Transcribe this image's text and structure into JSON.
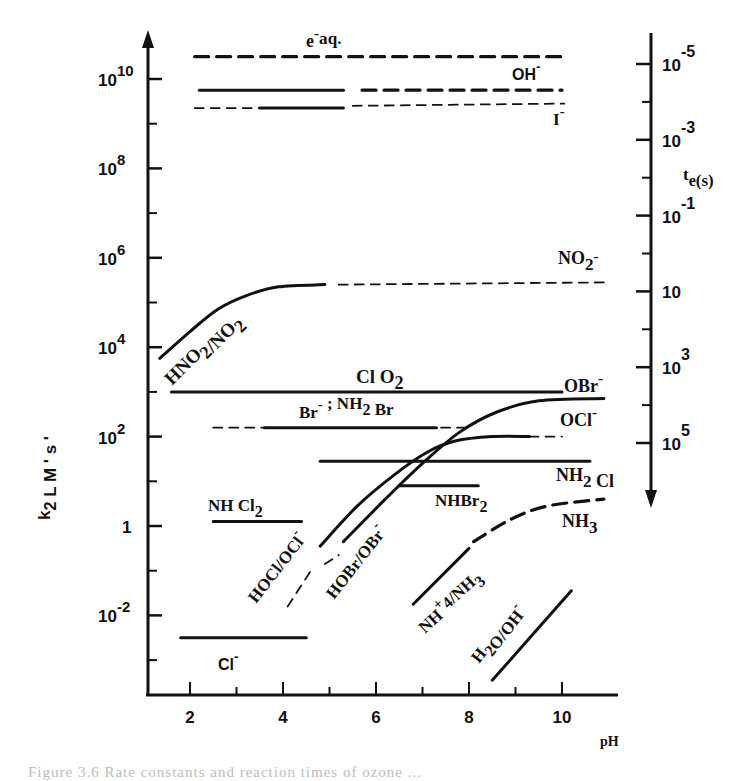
{
  "chart_data": {
    "type": "line",
    "title": "",
    "xlabel": "pH",
    "ylabel": "k2 L M' s'",
    "y2label": "te(s)",
    "xlim": [
      1.2,
      11.2
    ],
    "ylim_log10": [
      -4,
      11
    ],
    "x_ticks": [
      2,
      4,
      6,
      8,
      10
    ],
    "x_minor_ticks": [
      3,
      5,
      7,
      9
    ],
    "y_ticks": [
      {
        "log": 10,
        "label": "10",
        "exp": "10"
      },
      {
        "log": 8,
        "label": "10",
        "exp": "8"
      },
      {
        "log": 6,
        "label": "10",
        "exp": "6"
      },
      {
        "log": 4,
        "label": "10",
        "exp": "4"
      },
      {
        "log": 2,
        "label": "10",
        "exp": "2"
      },
      {
        "log": 0,
        "label": "1",
        "exp": ""
      },
      {
        "log": -2,
        "label": "10",
        "exp": "-2"
      }
    ],
    "y2_ticks": [
      {
        "label": "10",
        "exp": "-5"
      },
      {
        "label": "10",
        "exp": "-3"
      },
      {
        "label": "10",
        "exp": "-1"
      },
      {
        "label": "10",
        "exp": ""
      },
      {
        "label": "10",
        "exp": "3"
      },
      {
        "label": "10",
        "exp": "5"
      }
    ],
    "grid": false,
    "legend": "none (inline labels)",
    "series": [
      {
        "name": "e-aq",
        "style": "dashed-heavy",
        "points": [
          [
            2.1,
            10.5
          ],
          [
            10.0,
            10.5
          ]
        ]
      },
      {
        "name": "OH-",
        "segments": [
          {
            "style": "solid",
            "points": [
              [
                2.2,
                9.75
              ],
              [
                5.3,
                9.75
              ]
            ]
          },
          {
            "style": "dashed-heavy",
            "points": [
              [
                5.7,
                9.75
              ],
              [
                10.0,
                9.75
              ]
            ]
          }
        ]
      },
      {
        "name": "I-",
        "segments": [
          {
            "style": "dashed",
            "points": [
              [
                2.1,
                9.35
              ],
              [
                3.5,
                9.35
              ]
            ]
          },
          {
            "style": "solid",
            "points": [
              [
                3.5,
                9.35
              ],
              [
                5.3,
                9.35
              ]
            ]
          },
          {
            "style": "dashed",
            "points": [
              [
                5.5,
                9.4
              ],
              [
                10.05,
                9.45
              ]
            ]
          }
        ]
      },
      {
        "name": "NO2- (HNO2/NO2-)",
        "segments": [
          {
            "style": "solid",
            "points": [
              [
                1.35,
                3.75
              ],
              [
                2.0,
                4.35
              ],
              [
                2.6,
                4.85
              ],
              [
                3.2,
                5.15
              ],
              [
                3.9,
                5.35
              ],
              [
                4.9,
                5.4
              ]
            ]
          },
          {
            "style": "dashed",
            "points": [
              [
                5.2,
                5.4
              ],
              [
                10.95,
                5.45
              ]
            ]
          }
        ]
      },
      {
        "name": "ClO2",
        "style": "solid",
        "points": [
          [
            1.6,
            3.0
          ],
          [
            10.0,
            3.0
          ]
        ]
      },
      {
        "name": "Br- ; NH2Br",
        "segments": [
          {
            "style": "dashed",
            "points": [
              [
                2.5,
                2.2
              ],
              [
                3.6,
                2.2
              ]
            ]
          },
          {
            "style": "solid",
            "points": [
              [
                3.6,
                2.2
              ],
              [
                7.3,
                2.2
              ]
            ]
          },
          {
            "style": "dashed",
            "points": [
              [
                7.4,
                2.2
              ],
              [
                8.0,
                2.2
              ]
            ]
          }
        ]
      },
      {
        "name": "OBr- (HOBr/OBr-)",
        "segments": [
          {
            "style": "dashed",
            "points": [
              [
                4.9,
                -0.85
              ],
              [
                5.2,
                -0.65
              ]
            ]
          },
          {
            "style": "solid",
            "points": [
              [
                5.3,
                -0.35
              ],
              [
                6.2,
                0.6
              ],
              [
                7.0,
                1.4
              ],
              [
                7.8,
                2.1
              ],
              [
                8.6,
                2.55
              ],
              [
                9.5,
                2.8
              ],
              [
                10.9,
                2.85
              ]
            ]
          }
        ]
      },
      {
        "name": "OCl- (HOCl/OCl-)",
        "segments": [
          {
            "style": "dashed",
            "points": [
              [
                4.1,
                -1.8
              ],
              [
                4.6,
                -1.0
              ]
            ]
          },
          {
            "style": "solid",
            "points": [
              [
                4.8,
                -0.45
              ],
              [
                5.6,
                0.45
              ],
              [
                6.4,
                1.15
              ],
              [
                7.1,
                1.65
              ],
              [
                7.7,
                1.9
              ],
              [
                8.5,
                2.0
              ],
              [
                9.3,
                2.0
              ]
            ]
          },
          {
            "style": "dashed",
            "points": [
              [
                9.3,
                2.0
              ],
              [
                10.0,
                2.0
              ]
            ]
          }
        ]
      },
      {
        "name": "NH2Cl",
        "style": "solid",
        "points": [
          [
            4.8,
            1.45
          ],
          [
            10.6,
            1.45
          ]
        ]
      },
      {
        "name": "NHBr2",
        "style": "solid",
        "points": [
          [
            6.5,
            0.9
          ],
          [
            8.2,
            0.9
          ]
        ]
      },
      {
        "name": "NHCl2",
        "style": "solid",
        "points": [
          [
            2.5,
            0.1
          ],
          [
            4.4,
            0.1
          ]
        ]
      },
      {
        "name": "NH3 (NH4+/NH3)",
        "segments": [
          {
            "style": "solid",
            "points": [
              [
                6.8,
                -1.75
              ],
              [
                8.0,
                -0.5
              ]
            ]
          },
          {
            "style": "dashed-heavy",
            "points": [
              [
                8.1,
                -0.35
              ],
              [
                8.9,
                0.15
              ],
              [
                9.7,
                0.45
              ],
              [
                10.9,
                0.6
              ]
            ]
          }
        ]
      },
      {
        "name": "Cl-",
        "style": "solid",
        "points": [
          [
            1.8,
            -2.5
          ],
          [
            4.5,
            -2.5
          ]
        ]
      },
      {
        "name": "H2O/OH-",
        "style": "solid",
        "points": [
          [
            8.5,
            -3.45
          ],
          [
            10.2,
            -1.45
          ]
        ]
      }
    ],
    "annotations": [
      "e-aq.",
      "OH-",
      "I-",
      "NO2-",
      "HNO2/NO2-",
      "ClO2",
      "Br- ; NH2Br",
      "OBr-",
      "OCl-",
      "NH2Cl",
      "NHBr2",
      "NHCl2",
      "NH3",
      "HOCl/OCl-",
      "HOBr/OBr-",
      "NH4+/NH3",
      "H2O/OH-",
      "Cl-"
    ]
  },
  "labels": {
    "eaq": {
      "base": "e",
      "sup": "-",
      "sub": "aq."
    },
    "oh": {
      "base": "OH",
      "sup": "-"
    },
    "i": {
      "base": "I",
      "sup": "-"
    },
    "no2": {
      "base": "NO",
      "sub": "2",
      "sup": "-"
    },
    "hno2": {
      "text": "HNO",
      "sub": "2",
      "slash": "/NO",
      "sub2": "2"
    },
    "clo2": {
      "base": "Cl O",
      "sub": "2"
    },
    "br": {
      "base": "Br",
      "sup": "-",
      "sep": ";",
      "nh": "NH",
      "sub": "2",
      "tail": " Br"
    },
    "obr": {
      "base": "OBr",
      "sup": "-"
    },
    "ocl": {
      "base": "OCl",
      "sup": "-"
    },
    "nh2cl": {
      "base": "NH",
      "sub": "2",
      "tail": " Cl"
    },
    "nhbr2": {
      "base": "NHBr",
      "sub": "2"
    },
    "nhcl2": {
      "base": "NH Cl",
      "sub": "2"
    },
    "nh3": {
      "base": "NH",
      "sub": "3"
    },
    "hocl": {
      "text": "HOCl/OCl",
      "sup": "-"
    },
    "hobr": {
      "text": "HOBr/OBr",
      "sup": "-"
    },
    "nh4": {
      "base": "NH",
      "sup": "+",
      "sub": "4",
      "tail": "/NH",
      "sub2": "3"
    },
    "h2o": {
      "base": "H",
      "sub": "2",
      "tail": "O/OH",
      "sup": "-"
    },
    "cl": {
      "base": "Cl",
      "sup": "-"
    },
    "ylabel": {
      "k": "k",
      "sub": "2",
      "rest": "L M ' s '"
    },
    "y2label": {
      "t": "t",
      "sub": "e",
      "rest": "(s)"
    },
    "xlabel": "pH"
  },
  "caption": "Figure 3.6  Rate constants and reaction times of ozone ..."
}
